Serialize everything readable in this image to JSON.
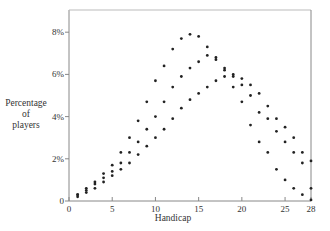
{
  "chart_data": {
    "type": "scatter",
    "title": "",
    "xlabel": "Handicap",
    "ylabel": [
      "Percentage",
      "of",
      "players"
    ],
    "xlim": [
      0,
      28
    ],
    "ylim": [
      0,
      9
    ],
    "grid": false,
    "legend": null,
    "x_ticks": [
      0,
      5,
      10,
      15,
      20,
      25,
      28
    ],
    "x_tick_labels": [
      "0",
      "5",
      "10",
      "15",
      "20",
      "25",
      "28"
    ],
    "y_ticks": [
      0,
      2,
      4,
      6,
      8
    ],
    "y_tick_labels": [
      "0",
      "2%",
      "4%",
      "6%",
      "8%"
    ],
    "x": [
      1,
      2,
      3,
      4,
      5,
      6,
      7,
      8,
      9,
      10,
      11,
      12,
      13,
      14,
      15,
      16,
      17,
      18,
      19,
      20,
      21,
      22,
      23,
      24,
      25,
      26,
      27,
      28
    ],
    "series": [
      {
        "name": "Series A (peak ~14)",
        "values": [
          0.3,
          0.6,
          0.9,
          1.3,
          1.7,
          2.3,
          3.0,
          3.8,
          4.7,
          5.7,
          6.4,
          7.2,
          7.7,
          7.9,
          7.8,
          7.3,
          6.8,
          6.2,
          5.4,
          4.7,
          3.6,
          2.8,
          2.3,
          1.5,
          1.0,
          0.6,
          0.3,
          0.05
        ]
      },
      {
        "name": "Series B (peak ~16)",
        "values": [
          0.3,
          0.5,
          0.8,
          1.1,
          1.4,
          1.8,
          2.3,
          2.8,
          3.4,
          4.0,
          4.7,
          5.4,
          5.9,
          6.3,
          6.6,
          6.9,
          6.7,
          6.3,
          5.9,
          5.5,
          5.0,
          4.2,
          3.9,
          3.3,
          2.8,
          2.3,
          1.8,
          0.6
        ]
      },
      {
        "name": "Series C (peak ~19)",
        "values": [
          0.2,
          0.4,
          0.6,
          0.9,
          1.2,
          1.5,
          1.8,
          2.2,
          2.6,
          3.0,
          3.4,
          3.9,
          4.4,
          4.8,
          5.1,
          5.4,
          5.7,
          5.9,
          6.0,
          5.8,
          5.5,
          5.1,
          4.5,
          3.9,
          3.5,
          3.0,
          2.3,
          1.9
        ]
      }
    ]
  }
}
